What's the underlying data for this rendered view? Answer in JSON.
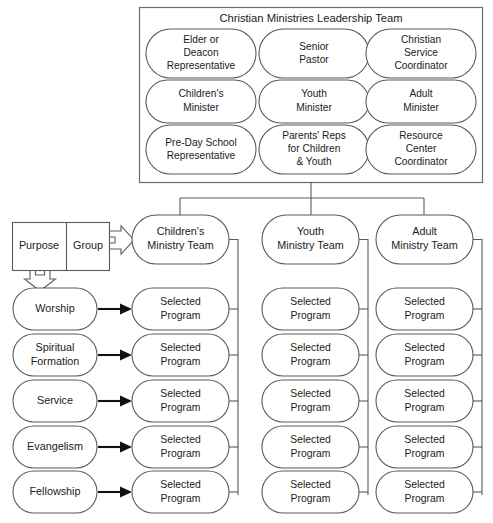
{
  "diagram": {
    "title": "Christian Ministries Leadership Team",
    "leadership_panel": {
      "title": "Christian Ministries Leadership Team",
      "members": [
        {
          "lines": [
            "Elder or",
            "Deacon",
            "Representative"
          ]
        },
        {
          "lines": [
            "Senior",
            "Pastor"
          ]
        },
        {
          "lines": [
            "Christian",
            "Service",
            "Coordinator"
          ]
        },
        {
          "lines": [
            "Children's",
            "Minister"
          ]
        },
        {
          "lines": [
            "Youth",
            "Minister"
          ]
        },
        {
          "lines": [
            "Adult",
            "Minister"
          ]
        },
        {
          "lines": [
            "Pre-Day School",
            "Representative"
          ]
        },
        {
          "lines": [
            "Parents' Reps",
            "for Children",
            "& Youth"
          ]
        },
        {
          "lines": [
            "Resource",
            "Center",
            "Coordinator"
          ]
        }
      ]
    },
    "legend": {
      "purpose_label": "Purpose",
      "group_label": "Group"
    },
    "teams": [
      {
        "lines": [
          "Children's",
          "Ministry Team"
        ]
      },
      {
        "lines": [
          "Youth",
          "Ministry Team"
        ]
      },
      {
        "lines": [
          "Adult",
          "Ministry Team"
        ]
      }
    ],
    "purposes": [
      {
        "lines": [
          "Worship"
        ]
      },
      {
        "lines": [
          "Spiritual",
          "Formation"
        ]
      },
      {
        "lines": [
          "Service"
        ]
      },
      {
        "lines": [
          "Evangelism"
        ]
      },
      {
        "lines": [
          "Fellowship"
        ]
      }
    ],
    "program_label": {
      "lines": [
        "Selected",
        "Program"
      ]
    },
    "program_grid": {
      "rows": 5,
      "columns": 3,
      "cells": [
        [
          {
            "lines": [
              "Selected",
              "Program"
            ]
          },
          {
            "lines": [
              "Selected",
              "Program"
            ]
          },
          {
            "lines": [
              "Selected",
              "Program"
            ]
          }
        ],
        [
          {
            "lines": [
              "Selected",
              "Program"
            ]
          },
          {
            "lines": [
              "Selected",
              "Program"
            ]
          },
          {
            "lines": [
              "Selected",
              "Program"
            ]
          }
        ],
        [
          {
            "lines": [
              "Selected",
              "Program"
            ]
          },
          {
            "lines": [
              "Selected",
              "Program"
            ]
          },
          {
            "lines": [
              "Selected",
              "Program"
            ]
          }
        ],
        [
          {
            "lines": [
              "Selected",
              "Program"
            ]
          },
          {
            "lines": [
              "Selected",
              "Program"
            ]
          },
          {
            "lines": [
              "Selected",
              "Program"
            ]
          }
        ],
        [
          {
            "lines": [
              "Selected",
              "Program"
            ]
          },
          {
            "lines": [
              "Selected",
              "Program"
            ]
          },
          {
            "lines": [
              "Selected",
              "Program"
            ]
          }
        ]
      ]
    },
    "colors": {
      "background": "#ffffff",
      "shape_stroke": "#5a5a5a",
      "panel_stroke": "#6b6b6b",
      "text": "#1b1b1b",
      "arrow_solid": "#111111"
    }
  }
}
